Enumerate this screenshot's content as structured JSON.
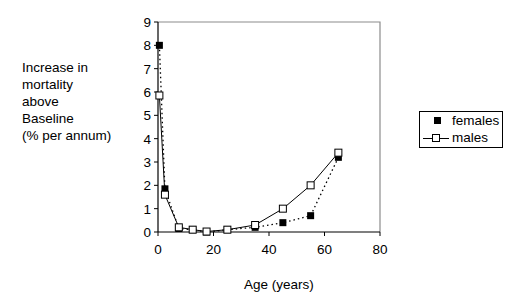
{
  "chart_data": {
    "type": "line",
    "title": "",
    "xlabel": "Age (years)",
    "ylabel": "Increase in mortality above Baseline (% per annum)",
    "ylabel_lines": [
      "Increase in",
      "mortality",
      "above",
      "Baseline",
      "(% per annum)"
    ],
    "xlim": [
      0,
      80
    ],
    "ylim": [
      0,
      9
    ],
    "xticks": [
      0,
      20,
      40,
      60,
      80
    ],
    "yticks": [
      0,
      1,
      2,
      3,
      4,
      5,
      6,
      7,
      8,
      9
    ],
    "grid": false,
    "legend_position": "right",
    "series": [
      {
        "name": "females",
        "marker": "filled-square",
        "line": "dotted",
        "x": [
          0.5,
          2.5,
          7.5,
          12.5,
          17.5,
          25,
          35,
          45,
          55,
          65
        ],
        "y": [
          8.0,
          1.85,
          0.15,
          0.1,
          0.0,
          0.1,
          0.2,
          0.4,
          0.7,
          3.2
        ]
      },
      {
        "name": "males",
        "marker": "open-square",
        "line": "solid",
        "x": [
          0.5,
          2.5,
          7.5,
          12.5,
          17.5,
          25,
          35,
          45,
          55,
          65
        ],
        "y": [
          5.85,
          1.6,
          0.2,
          0.1,
          0.02,
          0.1,
          0.3,
          1.0,
          2.0,
          3.4
        ]
      }
    ]
  },
  "legend": {
    "females": "females",
    "males": "males"
  },
  "colors": {
    "axis": "#000000",
    "frame": "#8c8c8c",
    "series": "#000000"
  }
}
